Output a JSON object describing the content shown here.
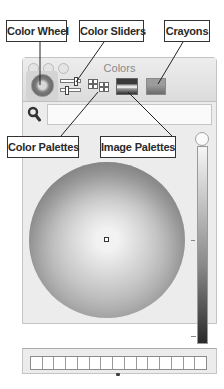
{
  "window": {
    "title": "Colors",
    "traffic_lights": [
      "close",
      "minimize",
      "zoom"
    ]
  },
  "toolbar": {
    "modes": [
      {
        "id": "color-wheel",
        "icon": "color-wheel-icon",
        "selected": true
      },
      {
        "id": "color-sliders",
        "icon": "color-sliders-icon",
        "selected": false
      },
      {
        "id": "color-palettes",
        "icon": "color-palettes-icon",
        "selected": false
      },
      {
        "id": "image-palettes",
        "icon": "image-palettes-icon",
        "selected": false
      },
      {
        "id": "crayons",
        "icon": "crayons-icon",
        "selected": false
      }
    ]
  },
  "search": {
    "icon": "magnifier-icon",
    "value": "",
    "placeholder": ""
  },
  "wheel": {
    "marker_position": "center",
    "brightness_slider": "top"
  },
  "swatches": {
    "count": 15,
    "colors": [
      "#ffffff",
      "#ffffff",
      "#ffffff",
      "#ffffff",
      "#ffffff",
      "#ffffff",
      "#ffffff",
      "#ffffff",
      "#ffffff",
      "#ffffff",
      "#ffffff",
      "#ffffff",
      "#ffffff",
      "#ffffff",
      "#ffffff"
    ]
  },
  "callouts": {
    "color_wheel": "Color Wheel",
    "color_sliders": "Color Sliders",
    "crayons": "Crayons",
    "color_palettes": "Color Palettes",
    "image_palettes": "Image Palettes"
  }
}
